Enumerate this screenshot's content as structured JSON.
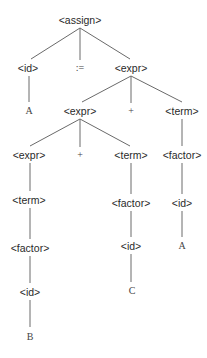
{
  "diagram": {
    "type": "parse-tree",
    "edge_color": "#6a6a6a",
    "text_color": "#2a2a2a",
    "nodes": [
      {
        "id": "n0",
        "label": "<assign>",
        "x": 80,
        "y": 20,
        "kind": "nonterminal"
      },
      {
        "id": "n1",
        "label": "<id>",
        "x": 28,
        "y": 68,
        "kind": "nonterminal"
      },
      {
        "id": "n2",
        "label": ":=",
        "x": 80,
        "y": 68,
        "kind": "terminal"
      },
      {
        "id": "n3",
        "label": "<expr>",
        "x": 131,
        "y": 68,
        "kind": "nonterminal"
      },
      {
        "id": "n4",
        "label": "A",
        "x": 29,
        "y": 111,
        "kind": "terminal"
      },
      {
        "id": "n5",
        "label": "<expr>",
        "x": 80,
        "y": 111,
        "kind": "nonterminal"
      },
      {
        "id": "n6",
        "label": "+",
        "x": 131,
        "y": 111,
        "kind": "terminal"
      },
      {
        "id": "n7",
        "label": "<term>",
        "x": 182,
        "y": 111,
        "kind": "nonterminal"
      },
      {
        "id": "n8",
        "label": "<expr>",
        "x": 29,
        "y": 155,
        "kind": "nonterminal"
      },
      {
        "id": "n9",
        "label": "+",
        "x": 80,
        "y": 155,
        "kind": "terminal"
      },
      {
        "id": "n10",
        "label": "<term>",
        "x": 131,
        "y": 155,
        "kind": "nonterminal"
      },
      {
        "id": "n11",
        "label": "<factor>",
        "x": 182,
        "y": 155,
        "kind": "nonterminal"
      },
      {
        "id": "n12",
        "label": "<term>",
        "x": 29,
        "y": 200,
        "kind": "nonterminal"
      },
      {
        "id": "n13",
        "label": "<factor>",
        "x": 131,
        "y": 203,
        "kind": "nonterminal"
      },
      {
        "id": "n14",
        "label": "<id>",
        "x": 182,
        "y": 203,
        "kind": "nonterminal"
      },
      {
        "id": "n15",
        "label": "<factor>",
        "x": 30,
        "y": 248,
        "kind": "nonterminal"
      },
      {
        "id": "n16",
        "label": "<id>",
        "x": 131,
        "y": 246,
        "kind": "nonterminal"
      },
      {
        "id": "n17",
        "label": "A",
        "x": 182,
        "y": 246,
        "kind": "terminal"
      },
      {
        "id": "n18",
        "label": "<id>",
        "x": 30,
        "y": 292,
        "kind": "nonterminal"
      },
      {
        "id": "n19",
        "label": "C",
        "x": 132,
        "y": 291,
        "kind": "terminal"
      },
      {
        "id": "n20",
        "label": "B",
        "x": 30,
        "y": 337,
        "kind": "terminal"
      }
    ],
    "edges": [
      {
        "from": "n0",
        "to": "n1",
        "x1": 80,
        "y1": 28,
        "x2": 31,
        "y2": 59
      },
      {
        "from": "n0",
        "to": "n2",
        "x1": 80,
        "y1": 28,
        "x2": 80,
        "y2": 60
      },
      {
        "from": "n0",
        "to": "n3",
        "x1": 80,
        "y1": 28,
        "x2": 130,
        "y2": 59
      },
      {
        "from": "n1",
        "to": "n4",
        "x1": 29,
        "y1": 76,
        "x2": 29,
        "y2": 102
      },
      {
        "from": "n3",
        "to": "n5",
        "x1": 131,
        "y1": 76,
        "x2": 82,
        "y2": 102
      },
      {
        "from": "n3",
        "to": "n6",
        "x1": 131,
        "y1": 76,
        "x2": 131,
        "y2": 103
      },
      {
        "from": "n3",
        "to": "n7",
        "x1": 131,
        "y1": 76,
        "x2": 182,
        "y2": 102
      },
      {
        "from": "n5",
        "to": "n8",
        "x1": 80,
        "y1": 119,
        "x2": 30,
        "y2": 146
      },
      {
        "from": "n5",
        "to": "n9",
        "x1": 80,
        "y1": 119,
        "x2": 80,
        "y2": 147
      },
      {
        "from": "n5",
        "to": "n10",
        "x1": 80,
        "y1": 119,
        "x2": 130,
        "y2": 146
      },
      {
        "from": "n7",
        "to": "n11",
        "x1": 182,
        "y1": 119,
        "x2": 182,
        "y2": 146
      },
      {
        "from": "n8",
        "to": "n12",
        "x1": 30,
        "y1": 163,
        "x2": 30,
        "y2": 191
      },
      {
        "from": "n10",
        "to": "n13",
        "x1": 131,
        "y1": 163,
        "x2": 131,
        "y2": 194
      },
      {
        "from": "n11",
        "to": "n14",
        "x1": 182,
        "y1": 163,
        "x2": 182,
        "y2": 194
      },
      {
        "from": "n12",
        "to": "n15",
        "x1": 30,
        "y1": 208,
        "x2": 30,
        "y2": 239
      },
      {
        "from": "n13",
        "to": "n16",
        "x1": 131,
        "y1": 211,
        "x2": 131,
        "y2": 237
      },
      {
        "from": "n14",
        "to": "n17",
        "x1": 182,
        "y1": 211,
        "x2": 182,
        "y2": 237
      },
      {
        "from": "n15",
        "to": "n18",
        "x1": 30,
        "y1": 256,
        "x2": 30,
        "y2": 283
      },
      {
        "from": "n16",
        "to": "n19",
        "x1": 131,
        "y1": 254,
        "x2": 131,
        "y2": 282
      },
      {
        "from": "n18",
        "to": "n20",
        "x1": 30,
        "y1": 300,
        "x2": 30,
        "y2": 327
      }
    ]
  }
}
